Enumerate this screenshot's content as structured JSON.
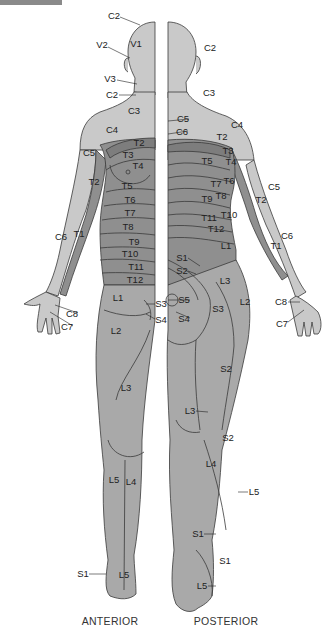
{
  "colors": {
    "light": "#c9c9c9",
    "mid": "#a9a9a9",
    "dark": "#8f8f8f",
    "darker": "#7d7d7d",
    "outline": "#3a3a3a",
    "text": "#222222"
  },
  "captions": {
    "anterior": "ANTERIOR",
    "posterior": "POSTERIOR"
  },
  "anterior_labels": [
    {
      "text": "C2",
      "x": 114,
      "y": 16
    },
    {
      "text": "V1",
      "x": 136,
      "y": 44
    },
    {
      "text": "V2",
      "x": 102,
      "y": 45
    },
    {
      "text": "V3",
      "x": 110,
      "y": 79
    },
    {
      "text": "C2",
      "x": 112,
      "y": 95
    },
    {
      "text": "C3",
      "x": 134,
      "y": 111
    },
    {
      "text": "C4",
      "x": 112,
      "y": 130
    },
    {
      "text": "T2",
      "x": 139,
      "y": 143
    },
    {
      "text": "C5",
      "x": 89,
      "y": 153
    },
    {
      "text": "T3",
      "x": 128,
      "y": 155
    },
    {
      "text": "T4",
      "x": 138,
      "y": 166
    },
    {
      "text": "T2",
      "x": 94,
      "y": 182
    },
    {
      "text": "T5",
      "x": 127,
      "y": 186
    },
    {
      "text": "T6",
      "x": 130,
      "y": 200
    },
    {
      "text": "T7",
      "x": 130,
      "y": 213
    },
    {
      "text": "T8",
      "x": 128,
      "y": 227
    },
    {
      "text": "T9",
      "x": 134,
      "y": 242
    },
    {
      "text": "T10",
      "x": 130,
      "y": 254
    },
    {
      "text": "C6",
      "x": 61,
      "y": 237
    },
    {
      "text": "T1",
      "x": 79,
      "y": 234
    },
    {
      "text": "T11",
      "x": 136,
      "y": 267
    },
    {
      "text": "T12",
      "x": 135,
      "y": 280
    },
    {
      "text": "L1",
      "x": 118,
      "y": 298
    },
    {
      "text": "S3",
      "x": 161,
      "y": 304
    },
    {
      "text": "C8",
      "x": 72,
      "y": 314
    },
    {
      "text": "S4",
      "x": 161,
      "y": 320
    },
    {
      "text": "C7",
      "x": 67,
      "y": 327
    },
    {
      "text": "L2",
      "x": 116,
      "y": 331
    },
    {
      "text": "L3",
      "x": 126,
      "y": 388
    },
    {
      "text": "L5",
      "x": 114,
      "y": 480
    },
    {
      "text": "L4",
      "x": 131,
      "y": 482
    },
    {
      "text": "S1",
      "x": 83,
      "y": 574
    },
    {
      "text": "L5",
      "x": 124,
      "y": 575
    }
  ],
  "posterior_labels": [
    {
      "text": "C2",
      "x": 210,
      "y": 48
    },
    {
      "text": "C3",
      "x": 209,
      "y": 93
    },
    {
      "text": "C5",
      "x": 183,
      "y": 119
    },
    {
      "text": "C4",
      "x": 237,
      "y": 125
    },
    {
      "text": "C6",
      "x": 182,
      "y": 132
    },
    {
      "text": "T2",
      "x": 222,
      "y": 137
    },
    {
      "text": "T3",
      "x": 228,
      "y": 151
    },
    {
      "text": "T5",
      "x": 207,
      "y": 161
    },
    {
      "text": "T4",
      "x": 231,
      "y": 162
    },
    {
      "text": "T6",
      "x": 229,
      "y": 181
    },
    {
      "text": "T7",
      "x": 216,
      "y": 184
    },
    {
      "text": "C5",
      "x": 274,
      "y": 187
    },
    {
      "text": "T9",
      "x": 207,
      "y": 199
    },
    {
      "text": "T8",
      "x": 221,
      "y": 196
    },
    {
      "text": "T2",
      "x": 261,
      "y": 200
    },
    {
      "text": "T11",
      "x": 209,
      "y": 218
    },
    {
      "text": "T10",
      "x": 229,
      "y": 215
    },
    {
      "text": "T12",
      "x": 216,
      "y": 229
    },
    {
      "text": "C6",
      "x": 287,
      "y": 236
    },
    {
      "text": "L1",
      "x": 226,
      "y": 246
    },
    {
      "text": "T1",
      "x": 276,
      "y": 246
    },
    {
      "text": "S1",
      "x": 182,
      "y": 258
    },
    {
      "text": "S2",
      "x": 182,
      "y": 271
    },
    {
      "text": "L3",
      "x": 225,
      "y": 281
    },
    {
      "text": "S5",
      "x": 184,
      "y": 300
    },
    {
      "text": "L2",
      "x": 245,
      "y": 302
    },
    {
      "text": "C8",
      "x": 281,
      "y": 302
    },
    {
      "text": "S3",
      "x": 218,
      "y": 309
    },
    {
      "text": "S4",
      "x": 184,
      "y": 319
    },
    {
      "text": "C7",
      "x": 282,
      "y": 324
    },
    {
      "text": "S2",
      "x": 226,
      "y": 369
    },
    {
      "text": "L3",
      "x": 190,
      "y": 411
    },
    {
      "text": "S2",
      "x": 228,
      "y": 438
    },
    {
      "text": "L4",
      "x": 211,
      "y": 464
    },
    {
      "text": "L5",
      "x": 254,
      "y": 492
    },
    {
      "text": "S1",
      "x": 198,
      "y": 534
    },
    {
      "text": "S1",
      "x": 225,
      "y": 561
    },
    {
      "text": "L5",
      "x": 202,
      "y": 586
    }
  ]
}
